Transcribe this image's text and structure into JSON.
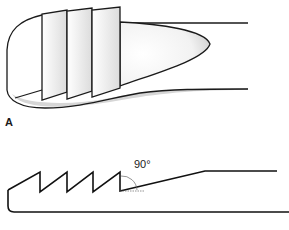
{
  "figure": {
    "panel_a_label": "A",
    "angle_label": "90°",
    "parts": [
      {
        "name": "instrument-tip-perspective",
        "description": "Rounded instrument tip with four angled serration plates and tapered shaft"
      },
      {
        "name": "instrument-tip-profile",
        "description": "Side profile with saw-tooth serrations and 90° angle marking"
      }
    ],
    "colors": {
      "stroke": "#1a1a1a",
      "shade": "#d9d9d9",
      "fill": "#ffffff"
    }
  }
}
